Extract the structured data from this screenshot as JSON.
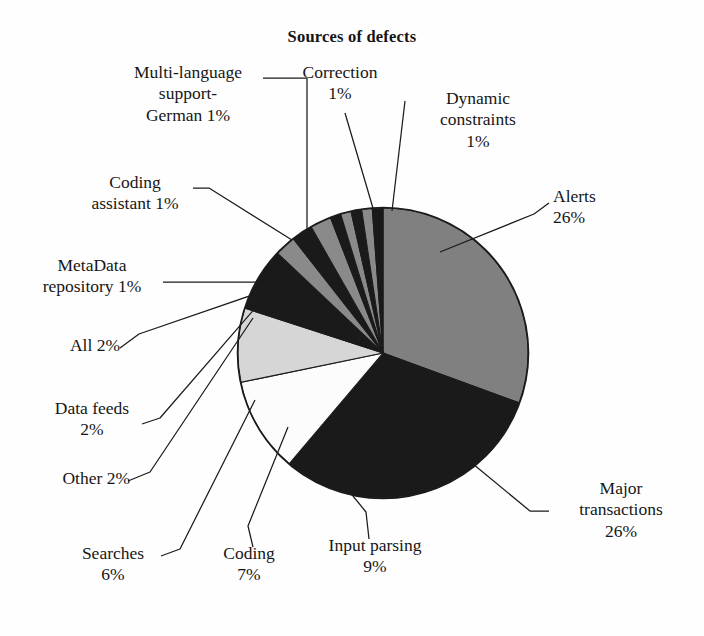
{
  "chart_data": {
    "type": "pie",
    "title": "Sources of defects",
    "xlabel": "",
    "ylabel": "",
    "legend_position": "none",
    "grid": false,
    "value_unit": "%",
    "start_angle_deg": 0,
    "direction": "clockwise",
    "categories": [
      "Alerts",
      "Major transactions",
      "Input parsing",
      "Coding",
      "Searches",
      "Other",
      "Data feeds",
      "All",
      "MetaData repository",
      "Coding assistant",
      "Multi-language support-German",
      "Correction",
      "Dynamic constraints"
    ],
    "values": [
      26,
      26,
      9,
      7,
      6,
      2,
      2,
      2,
      1,
      1,
      1,
      1,
      1
    ],
    "slice_colors": [
      "#808080",
      "#1a1a1a",
      "#fcfcfc",
      "#d6d6d6",
      "#1a1a1a",
      "#8a8a8a",
      "#1a1a1a",
      "#8a8a8a",
      "#1a1a1a",
      "#8a8a8a",
      "#1a1a1a",
      "#8a8a8a",
      "#1a1a1a"
    ],
    "slices": [
      {
        "label": "Alerts",
        "value": 26,
        "text": "Alerts\n26%",
        "color": "#808080"
      },
      {
        "label": "Major transactions",
        "value": 26,
        "text": "Major\ntransactions\n26%",
        "color": "#1a1a1a"
      },
      {
        "label": "Input parsing",
        "value": 9,
        "text": "Input parsing\n9%",
        "color": "#fcfcfc"
      },
      {
        "label": "Coding",
        "value": 7,
        "text": "Coding\n7%",
        "color": "#d6d6d6"
      },
      {
        "label": "Searches",
        "value": 6,
        "text": "Searches\n6%",
        "color": "#1a1a1a"
      },
      {
        "label": "Other",
        "value": 2,
        "text": "Other 2%",
        "color": "#8a8a8a"
      },
      {
        "label": "Data feeds",
        "value": 2,
        "text": "Data feeds\n2%",
        "color": "#1a1a1a"
      },
      {
        "label": "All",
        "value": 2,
        "text": "All 2%",
        "color": "#8a8a8a"
      },
      {
        "label": "MetaData repository",
        "value": 1,
        "text": "MetaData\nrepository 1%",
        "color": "#1a1a1a"
      },
      {
        "label": "Coding assistant",
        "value": 1,
        "text": "Coding\nassistant 1%",
        "color": "#8a8a8a"
      },
      {
        "label": "Multi-language support-German",
        "value": 1,
        "text": "Multi-language\nsupport-\nGerman 1%",
        "color": "#1a1a1a"
      },
      {
        "label": "Correction",
        "value": 1,
        "text": "Correction\n1%",
        "color": "#8a8a8a"
      },
      {
        "label": "Dynamic constraints",
        "value": 1,
        "text": "Dynamic\nconstraints\n1%",
        "color": "#1a1a1a"
      }
    ]
  },
  "labels": {
    "multi_language": "Multi-language\nsupport-\nGerman 1%",
    "correction": "Correction\n1%",
    "dynamic_constraints": "Dynamic\nconstraints\n1%",
    "alerts": "Alerts\n26%",
    "coding_assistant": "Coding\nassistant 1%",
    "metadata_repository": "MetaData\nrepository 1%",
    "all": "All 2%",
    "data_feeds": "Data feeds\n2%",
    "other": "Other 2%",
    "searches": "Searches\n6%",
    "coding": "Coding\n7%",
    "input_parsing": "Input parsing\n9%",
    "major_transactions": "Major\ntransactions\n26%"
  },
  "style": {
    "background": "#fefefe",
    "outline": "#1b1b1b",
    "text": "#161616"
  }
}
